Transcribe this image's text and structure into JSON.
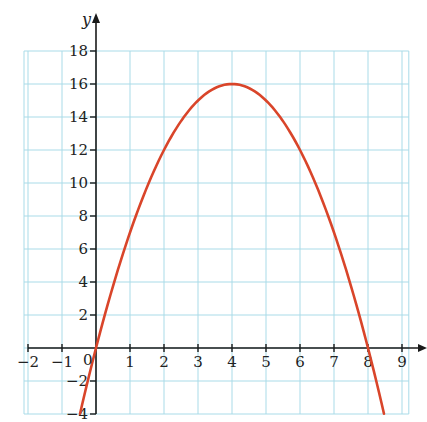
{
  "chart_data": {
    "type": "line",
    "title": "",
    "xlabel": "x",
    "ylabel": "y",
    "xlim": [
      -2,
      9.2
    ],
    "ylim": [
      -4,
      18
    ],
    "grid": true,
    "x_ticks": [
      -2,
      -1,
      0,
      1,
      2,
      3,
      4,
      5,
      6,
      7,
      8,
      9
    ],
    "x_tick_labels": [
      "−2",
      "−1",
      "0",
      "1",
      "2",
      "3",
      "4",
      "5",
      "6",
      "7",
      "8",
      "9"
    ],
    "y_ticks": [
      -4,
      -2,
      2,
      4,
      6,
      8,
      10,
      12,
      14,
      16,
      18
    ],
    "y_tick_labels": [
      "−4",
      "−2",
      "2",
      "4",
      "6",
      "8",
      "10",
      "12",
      "14",
      "16",
      "18"
    ],
    "series": [
      {
        "name": "y = 8x − x²",
        "color": "#d9452a",
        "x": [
          -0.47,
          0,
          1,
          2,
          3,
          4,
          5,
          6,
          7,
          8,
          8.47
        ],
        "y": [
          -4,
          0,
          7,
          12,
          15,
          16,
          15,
          12,
          7,
          0,
          -4
        ]
      }
    ],
    "annotations": [
      {
        "text": "vertex",
        "x": 4,
        "y": 16
      },
      {
        "text": "root",
        "x": 0,
        "y": 0
      },
      {
        "text": "root",
        "x": 8,
        "y": 0
      }
    ]
  },
  "colors": {
    "grid": "#a9dbe8",
    "axis": "#1a1a1a",
    "curve": "#d9452a",
    "background": "#ffffff"
  },
  "labels": {
    "y_axis": "y",
    "origin": "0"
  }
}
